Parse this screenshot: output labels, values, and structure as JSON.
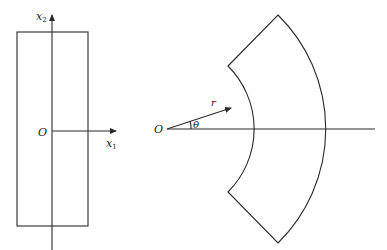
{
  "figure_left": {
    "origin_label": "O",
    "x1_label": "x",
    "x1_sub": "1",
    "x2_label": "x",
    "x2_sub": "2",
    "shape": "rectangle"
  },
  "figure_right": {
    "origin_label": "O",
    "r_label": "r",
    "theta_label": "θ",
    "shape": "annular-sector"
  },
  "colors": {
    "line": "#2a2a2a",
    "background": "#ffffff"
  }
}
